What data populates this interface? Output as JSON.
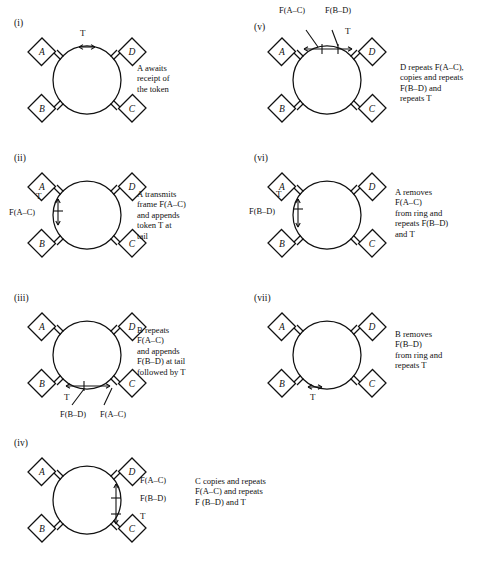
{
  "figure": {
    "node_names": [
      "A",
      "B",
      "C",
      "D"
    ],
    "token_symbol": "T",
    "ink_color": "#111111",
    "paper_color": "#ffffff"
  },
  "panels": [
    {
      "id": "i",
      "label": "(i)",
      "nodes": {
        "top_left": "A",
        "top_right": "D",
        "bottom_left": "B",
        "bottom_right": "C"
      },
      "caption": "A awaits\nreceipt of\nthe token",
      "caption_lead_italic": "A",
      "arc_labels": [
        {
          "name": "token-label",
          "text": "T",
          "position": "top"
        }
      ]
    },
    {
      "id": "ii",
      "label": "(ii)",
      "nodes": {
        "top_left": "A",
        "top_right": "D",
        "bottom_left": "B",
        "bottom_right": "C"
      },
      "caption": "A transmits\nframe F(A–C)\nand appends\ntoken T at\ntail",
      "caption_lead_italic": "A",
      "arc_labels": [
        {
          "name": "token-label",
          "text": "T",
          "position": "left-upper"
        },
        {
          "name": "frame-ac-label",
          "text": "F(A–C)",
          "position": "left-lower"
        }
      ]
    },
    {
      "id": "iii",
      "label": "(iii)",
      "nodes": {
        "top_left": "A",
        "top_right": "D",
        "bottom_left": "B",
        "bottom_right": "C"
      },
      "caption": "B repeats\nF(A–C)\nand appends\nF(B–D) at tail\nfollowed by T",
      "caption_lead_italic": "B",
      "arc_labels": [
        {
          "name": "token-label",
          "text": "T",
          "position": "bottom-left"
        },
        {
          "name": "frame-bd-label",
          "text": "F(B–D)",
          "position": "bottom-under-left"
        },
        {
          "name": "frame-ac-label",
          "text": "F(A–C)",
          "position": "bottom-under-right"
        }
      ]
    },
    {
      "id": "iv",
      "label": "(iv)",
      "nodes": {
        "top_left": "A",
        "top_right": "D",
        "bottom_left": "B",
        "bottom_right": "C"
      },
      "caption": "C copies and repeats\nF(A–C) and repeats\nF (B–D) and T",
      "caption_lead_italic": "C",
      "arc_labels": [
        {
          "name": "frame-ac-label",
          "text": "F(A–C)",
          "position": "right-upper"
        },
        {
          "name": "frame-bd-label",
          "text": "F(B–D)",
          "position": "right-middle"
        },
        {
          "name": "token-label",
          "text": "T",
          "position": "right-lower"
        }
      ]
    },
    {
      "id": "v",
      "label": "(v)",
      "nodes": {
        "top_left": "A",
        "top_right": "D",
        "bottom_left": "B",
        "bottom_right": "C"
      },
      "caption": "D repeats F(A–C),\ncopies and repeats\nF(B–D) and\nrepeats T",
      "caption_lead_italic": "D",
      "arc_labels": [
        {
          "name": "frame-ac-label",
          "text": "F(A–C)",
          "position": "above-left"
        },
        {
          "name": "frame-bd-label",
          "text": "F(B–D)",
          "position": "above-right"
        },
        {
          "name": "token-label",
          "text": "T",
          "position": "top-right"
        }
      ]
    },
    {
      "id": "vi",
      "label": "(vi)",
      "nodes": {
        "top_left": "A",
        "top_right": "D",
        "bottom_left": "B",
        "bottom_right": "C"
      },
      "caption": "A removes\nF(A–C)\nfrom ring and\nrepeats F(B–D)\nand T",
      "caption_lead_italic": "A",
      "arc_labels": [
        {
          "name": "token-label",
          "text": "T",
          "position": "left-upper"
        },
        {
          "name": "frame-bd-label",
          "text": "F(B–D)",
          "position": "left-lower"
        }
      ]
    },
    {
      "id": "vii",
      "label": "(vii)",
      "nodes": {
        "top_left": "A",
        "top_right": "D",
        "bottom_left": "B",
        "bottom_right": "C"
      },
      "caption": "B removes\nF(B–D)\nfrom ring and\nrepeats T",
      "caption_lead_italic": "B",
      "arc_labels": [
        {
          "name": "token-label",
          "text": "T",
          "position": "bottom-left"
        }
      ]
    }
  ]
}
